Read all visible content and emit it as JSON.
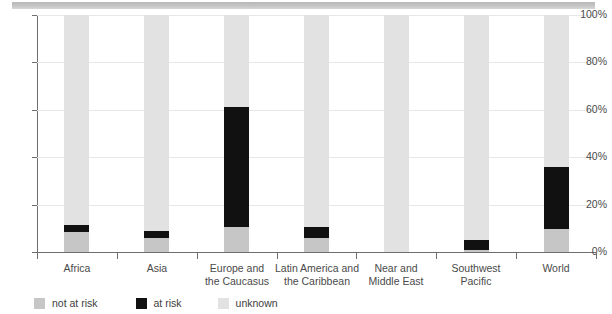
{
  "chart_data": {
    "type": "bar",
    "stacked": true,
    "title": "",
    "subtitle": "",
    "xlabel": "",
    "ylabel": "",
    "ylim": [
      0,
      100
    ],
    "ytick_labels": [
      "0%",
      "20%",
      "40%",
      "60%",
      "80%",
      "100%"
    ],
    "ytick_values": [
      0,
      20,
      40,
      60,
      80,
      100
    ],
    "grid": true,
    "legend_position": "bottom-left",
    "categories": [
      "Africa",
      "Asia",
      "Europe and the Caucasus",
      "Latin America and the Caribbean",
      "Near and Middle East",
      "Southwest Pacific",
      "World"
    ],
    "category_lines": [
      [
        "Africa"
      ],
      [
        "Asia"
      ],
      [
        "Europe and",
        "the Caucasus"
      ],
      [
        "Latin America and",
        "the Caribbean"
      ],
      [
        "Near and",
        "Middle East"
      ],
      [
        "Southwest",
        "Pacific"
      ],
      [
        "World"
      ]
    ],
    "series": [
      {
        "name": "not at risk",
        "color": "#c6c6c6",
        "values": [
          8.5,
          6.0,
          10.5,
          6.0,
          0.0,
          0.8,
          9.7
        ]
      },
      {
        "name": "at risk",
        "color": "#111111",
        "values": [
          2.9,
          2.9,
          50.5,
          4.5,
          0.0,
          4.2,
          26.1
        ]
      },
      {
        "name": "unknown",
        "color": "#e2e2e2",
        "values": [
          88.6,
          91.1,
          39.0,
          89.5,
          100.0,
          95.0,
          64.2
        ]
      }
    ]
  },
  "legend": {
    "items": [
      {
        "label": "not at risk",
        "color": "#c6c6c6"
      },
      {
        "label": "at risk",
        "color": "#111111"
      },
      {
        "label": "unknown",
        "color": "#e2e2e2"
      }
    ]
  },
  "banner": {
    "color": "#c2c2c2"
  }
}
